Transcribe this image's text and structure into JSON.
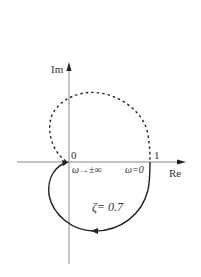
{
  "diagram": {
    "type": "nyquist-plot",
    "axes": {
      "imag_label": "Im",
      "real_label": "Re"
    },
    "ticks": {
      "origin": "0",
      "one": "1"
    },
    "annotations": {
      "omega_infinity": "ω→±∞",
      "omega_zero": "ω=0",
      "damping": "ζ= 0.7"
    },
    "curves": [
      {
        "name": "positive-frequency",
        "style": "solid"
      },
      {
        "name": "negative-frequency",
        "style": "dashed"
      }
    ],
    "colors": {
      "curve": "#222222",
      "axis": "#888888",
      "text": "#333333"
    }
  }
}
